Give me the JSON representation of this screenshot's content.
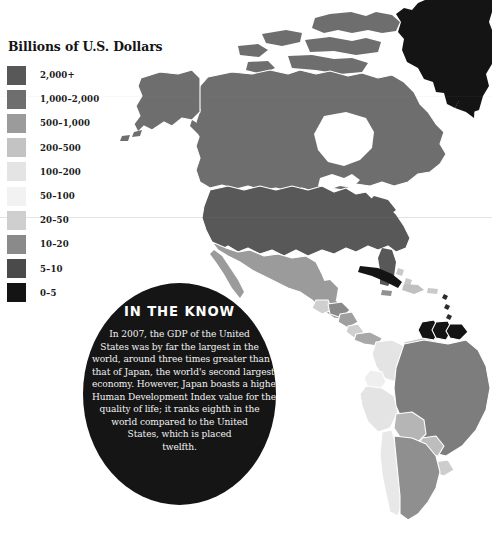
{
  "body_copy": {
    "lines": [
      "GDP remains a useful, if narrow, yardstick of a",
      "nation's economic status."
    ]
  },
  "legend": {
    "title": "Billions of U.S. Dollars",
    "items": [
      {
        "label": "2,000+",
        "color": "#585858"
      },
      {
        "label": "1,000–2,000",
        "color": "#6e6e6e"
      },
      {
        "label": "500–1,000",
        "color": "#9b9b9b"
      },
      {
        "label": "200–500",
        "color": "#c3c3c3"
      },
      {
        "label": "100–200",
        "color": "#e4e4e4"
      },
      {
        "label": "50–100",
        "color": "#f2f2f2"
      },
      {
        "label": "20–50",
        "color": "#cfcfcf"
      },
      {
        "label": "10–20",
        "color": "#8a8a8a"
      },
      {
        "label": "5–10",
        "color": "#4a4a4a"
      },
      {
        "label": "0–5",
        "color": "#141414"
      }
    ]
  },
  "in_the_know": {
    "heading": "IN THE KNOW",
    "lines": [
      "In 2007, the GDP of the United",
      "States was by far the largest in the",
      "world, around three times greater than",
      "that of Japan, the world's second largest",
      "economy. However, Japan boasts a higher",
      "Human Development Index value for the",
      "quality of life; it ranks eighth in the",
      "world compared to the United",
      "States, which is placed",
      "twelfth."
    ],
    "background_color": "#151515",
    "text_color": "#f2f2f2"
  },
  "map": {
    "title": "World GDP choropleth — Americas and Greenland",
    "background_color": "#ffffff",
    "border_color": "#ffffff",
    "regions": [
      {
        "name": "greenland",
        "legend_label": "0–5",
        "color": "#141414"
      },
      {
        "name": "canada",
        "legend_label": "1,000–2,000",
        "color": "#6e6e6e"
      },
      {
        "name": "alaska",
        "legend_label": "1,000–2,000",
        "color": "#6e6e6e"
      },
      {
        "name": "united-states",
        "legend_label": "2,000+",
        "color": "#585858"
      },
      {
        "name": "mexico",
        "legend_label": "500–1,000",
        "color": "#9b9b9b"
      },
      {
        "name": "guatemala",
        "legend_label": "20–50",
        "color": "#cfcfcf"
      },
      {
        "name": "honduras",
        "legend_label": "10–20",
        "color": "#8a8a8a"
      },
      {
        "name": "nicaragua",
        "legend_label": "5–10",
        "color": "#9f9f9f"
      },
      {
        "name": "costa-rica",
        "legend_label": "20–50",
        "color": "#cfcfcf"
      },
      {
        "name": "panama",
        "legend_label": "10–20",
        "color": "#a8a8a8"
      },
      {
        "name": "cuba",
        "legend_label": "0–5",
        "color": "#141414"
      },
      {
        "name": "bahamas",
        "legend_label": "5–10",
        "color": "#c9c9c9"
      },
      {
        "name": "hispaniola",
        "legend_label": "20–50",
        "color": "#c0c0c0"
      },
      {
        "name": "jamaica",
        "legend_label": "10–20",
        "color": "#909090"
      },
      {
        "name": "puerto-rico",
        "legend_label": "50–100",
        "color": "#cacaca"
      },
      {
        "name": "lesser-antilles",
        "legend_label": "0–5",
        "color": "#2a2a2a"
      },
      {
        "name": "colombia",
        "legend_label": "100–200",
        "color": "#e4e4e4"
      },
      {
        "name": "venezuela",
        "legend_label": "200–500",
        "color": "#c3c3c3"
      },
      {
        "name": "guyana",
        "legend_label": "0–5",
        "color": "#141414"
      },
      {
        "name": "suriname",
        "legend_label": "0–5",
        "color": "#141414"
      },
      {
        "name": "french-guiana",
        "legend_label": "0–5",
        "color": "#141414"
      },
      {
        "name": "ecuador",
        "legend_label": "50–100",
        "color": "#efefef"
      },
      {
        "name": "peru",
        "legend_label": "100–200",
        "color": "#e4e4e4"
      },
      {
        "name": "brazil",
        "legend_label": "1,000–2,000",
        "color": "#7d7d7d"
      },
      {
        "name": "bolivia",
        "legend_label": "10–20",
        "color": "#b5b5b5"
      },
      {
        "name": "paraguay",
        "legend_label": "10–20",
        "color": "#bdbdbd"
      },
      {
        "name": "uruguay",
        "legend_label": "20–50",
        "color": "#cdcdcd"
      },
      {
        "name": "chile",
        "legend_label": "100–200",
        "color": "#e8e8e8"
      },
      {
        "name": "argentina",
        "legend_label": "200–500",
        "color": "#8f8f8f"
      }
    ]
  }
}
